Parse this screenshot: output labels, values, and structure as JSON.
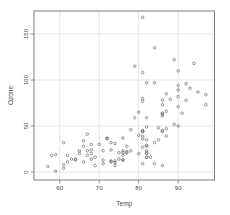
{
  "chart_data": {
    "type": "scatter",
    "title": "",
    "xlabel": "Temp",
    "ylabel": "Ozone",
    "x_ticks": [
      60,
      70,
      80,
      90
    ],
    "y_ticks": [
      0,
      50,
      100,
      150
    ],
    "xlim": [
      53.5,
      99.2
    ],
    "ylim": [
      -8.7,
      175
    ],
    "grid": true,
    "legend": "none",
    "marker": "open-circle",
    "points": [
      [
        67,
        41
      ],
      [
        72,
        36
      ],
      [
        74,
        12
      ],
      [
        62,
        18
      ],
      [
        66,
        28
      ],
      [
        65,
        23
      ],
      [
        59,
        19
      ],
      [
        61,
        8
      ],
      [
        74,
        7
      ],
      [
        69,
        16
      ],
      [
        66,
        11
      ],
      [
        68,
        14
      ],
      [
        58,
        18
      ],
      [
        64,
        14
      ],
      [
        66,
        34
      ],
      [
        57,
        6
      ],
      [
        68,
        30
      ],
      [
        62,
        11
      ],
      [
        59,
        1
      ],
      [
        73,
        11
      ],
      [
        61,
        4
      ],
      [
        61,
        32
      ],
      [
        67,
        23
      ],
      [
        81,
        45
      ],
      [
        79,
        115
      ],
      [
        76,
        37
      ],
      [
        82,
        29
      ],
      [
        90,
        71
      ],
      [
        87,
        39
      ],
      [
        82,
        23
      ],
      [
        77,
        21
      ],
      [
        72,
        37
      ],
      [
        65,
        20
      ],
      [
        73,
        12
      ],
      [
        76,
        13
      ],
      [
        84,
        135
      ],
      [
        82,
        49
      ],
      [
        73,
        32
      ],
      [
        91,
        64
      ],
      [
        80,
        40
      ],
      [
        81,
        77
      ],
      [
        82,
        97
      ],
      [
        84,
        97
      ],
      [
        87,
        85
      ],
      [
        74,
        10
      ],
      [
        81,
        27
      ],
      [
        86,
        7
      ],
      [
        85,
        48
      ],
      [
        82,
        35
      ],
      [
        86,
        61
      ],
      [
        88,
        79
      ],
      [
        86,
        63
      ],
      [
        83,
        16
      ],
      [
        81,
        80
      ],
      [
        81,
        108
      ],
      [
        82,
        20
      ],
      [
        89,
        52
      ],
      [
        90,
        82
      ],
      [
        90,
        50
      ],
      [
        86,
        64
      ],
      [
        82,
        59
      ],
      [
        81,
        39
      ],
      [
        81,
        9
      ],
      [
        82,
        16
      ],
      [
        86,
        78
      ],
      [
        85,
        35
      ],
      [
        87,
        66
      ],
      [
        89,
        122
      ],
      [
        90,
        89
      ],
      [
        90,
        110
      ],
      [
        86,
        44
      ],
      [
        82,
        28
      ],
      [
        80,
        65
      ],
      [
        77,
        22
      ],
      [
        79,
        59
      ],
      [
        76,
        23
      ],
      [
        74,
        31
      ],
      [
        81,
        44
      ],
      [
        82,
        21
      ],
      [
        84,
        9
      ],
      [
        86,
        45
      ],
      [
        81,
        168
      ],
      [
        86,
        73
      ],
      [
        97,
        73
      ],
      [
        94,
        118
      ],
      [
        95,
        87
      ],
      [
        97,
        84
      ],
      [
        92,
        96
      ],
      [
        92,
        78
      ],
      [
        93,
        91
      ],
      [
        90,
        94
      ],
      [
        87,
        47
      ],
      [
        84,
        32
      ],
      [
        80,
        20
      ],
      [
        78,
        23
      ],
      [
        75,
        21
      ],
      [
        73,
        24
      ],
      [
        81,
        44
      ],
      [
        76,
        21
      ],
      [
        77,
        28
      ],
      [
        71,
        9
      ],
      [
        71,
        13
      ],
      [
        78,
        46
      ],
      [
        67,
        18
      ],
      [
        76,
        13
      ],
      [
        68,
        24
      ],
      [
        82,
        16
      ],
      [
        64,
        13
      ],
      [
        71,
        23
      ],
      [
        81,
        36
      ],
      [
        69,
        7
      ],
      [
        63,
        14
      ],
      [
        70,
        30
      ],
      [
        75,
        14
      ],
      [
        76,
        18
      ],
      [
        68,
        20
      ]
    ]
  },
  "style": {
    "background": "#ffffff",
    "grid_color": "#e3e3e3",
    "axis_color": "#7f7f7f",
    "text_color": "#4a4a4a",
    "point_color": "#5d5d5d"
  },
  "layout": {
    "width": 230,
    "height": 215,
    "plot_left": 34,
    "plot_top": 11,
    "plot_right": 214.5,
    "plot_bottom": 180,
    "tick_len": 3.5,
    "point_radius": 1.3
  }
}
